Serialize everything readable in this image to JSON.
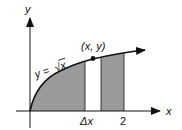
{
  "diagram": {
    "axes": {
      "x_label": "x",
      "y_label": "y"
    },
    "curve_label": "y = √x",
    "curve_label_parts": {
      "lhs": "y = ",
      "radical": "√",
      "radicand": "x"
    },
    "point_label": "(x, y)",
    "delta_label": "Δx",
    "tick_label": "2",
    "colors": {
      "shade": "#9a9a9a",
      "line": "#111111",
      "background": "#ffffff"
    }
  }
}
